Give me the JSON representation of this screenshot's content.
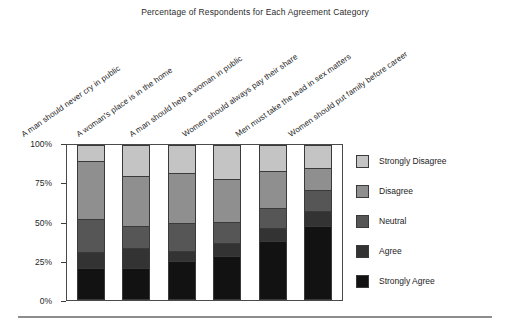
{
  "chart_data": {
    "type": "bar",
    "subtype": "stacked-bar-100-percent",
    "title": "Percentage of Respondents for Each Agreement Category",
    "xlabel": "",
    "ylabel": "",
    "ylim": [
      0,
      100
    ],
    "yticks": [
      "0%",
      "25%",
      "50%",
      "75%",
      "100%"
    ],
    "ytick_values": [
      0,
      25,
      50,
      75,
      100
    ],
    "grid": false,
    "legend_position": "right",
    "categories": [
      "A man should never cry in public",
      "A woman's place is in the home",
      "A man should help a woman in public",
      "Women should always pay their share",
      "Men must take the lead in sex matters",
      "Women should put family before career"
    ],
    "series": [
      {
        "name": "Strongly Disagree",
        "color": "#c4c4c4",
        "values": [
          10,
          20,
          18,
          22,
          17,
          15
        ]
      },
      {
        "name": "Disagree",
        "color": "#8f8f8f",
        "values": [
          38,
          33,
          33,
          28,
          24,
          14
        ]
      },
      {
        "name": "Neutral",
        "color": "#565656",
        "values": [
          22,
          14,
          18,
          14,
          13,
          13
        ]
      },
      {
        "name": "Agree",
        "color": "#333333",
        "values": [
          10,
          13,
          6,
          8,
          8,
          10
        ]
      },
      {
        "name": "Strongly Agree",
        "color": "#121212",
        "values": [
          20,
          20,
          25,
          28,
          38,
          48
        ]
      }
    ]
  },
  "legend": {
    "items": [
      {
        "label": "Strongly Disagree",
        "color": "#c4c4c4"
      },
      {
        "label": "Disagree",
        "color": "#8f8f8f"
      },
      {
        "label": "Neutral",
        "color": "#565656"
      },
      {
        "label": "Agree",
        "color": "#333333"
      },
      {
        "label": "Strongly Agree",
        "color": "#121212"
      }
    ]
  }
}
